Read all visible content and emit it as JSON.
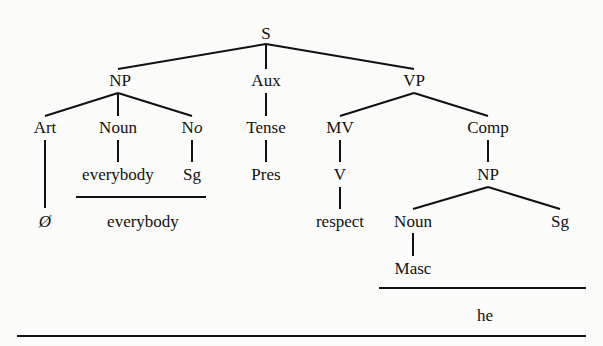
{
  "diagram": {
    "type": "syntax-tree",
    "nodes": {
      "s": "S",
      "np1": "NP",
      "aux": "Aux",
      "vp": "VP",
      "art": "Art",
      "noun1": "Noun",
      "no": "No",
      "tense": "Tense",
      "mv": "MV",
      "comp": "Comp",
      "everybody1": "everybody",
      "sg1": "Sg",
      "pres": "Pres",
      "v": "V",
      "np2": "NP",
      "null_art": "Ø",
      "everybody2": "everybody",
      "respect": "respect",
      "noun2": "Noun",
      "sg2": "Sg",
      "masc": "Masc",
      "he": "he"
    },
    "edges": [
      [
        "S",
        "NP"
      ],
      [
        "S",
        "Aux"
      ],
      [
        "S",
        "VP"
      ],
      [
        "NP",
        "Art"
      ],
      [
        "NP",
        "Noun"
      ],
      [
        "NP",
        "No"
      ],
      [
        "Aux",
        "Tense"
      ],
      [
        "VP",
        "MV"
      ],
      [
        "VP",
        "Comp"
      ],
      [
        "Art",
        "Ø"
      ],
      [
        "Noun",
        "everybody"
      ],
      [
        "No",
        "Sg"
      ],
      [
        "Tense",
        "Pres"
      ],
      [
        "MV",
        "V"
      ],
      [
        "V",
        "respect"
      ],
      [
        "Comp",
        "NP"
      ],
      [
        "NP",
        "Noun"
      ],
      [
        "NP",
        "Sg"
      ],
      [
        "Noun",
        "Masc"
      ]
    ]
  }
}
